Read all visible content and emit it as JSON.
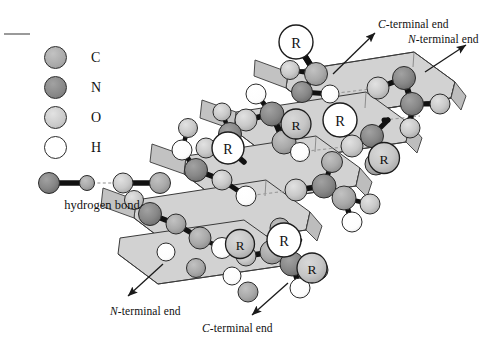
{
  "figure": {
    "background_color": "#ffffff"
  },
  "colors": {
    "carbon": "#a9a9a9",
    "nitrogen": "#878787",
    "oxygen": "#c9c9c9",
    "hydrogen": "#ffffff",
    "r_group_front": "#ffffff",
    "r_group_back": "#c6c6c6",
    "ribbon_top": "#d2d2d2",
    "ribbon_side": "#bdbdbd",
    "ribbon_edge": "#3a3a3a",
    "bond": "#111111",
    "hydrogen_bond": "#9b9b9b",
    "outline": "#2b2b2b",
    "arrow": "#1a1a1a",
    "crop_mark": "#9a9a9a"
  },
  "legend": {
    "atoms": [
      {
        "symbol": "C",
        "name": "carbon",
        "color_key": "carbon"
      },
      {
        "symbol": "N",
        "name": "nitrogen",
        "color_key": "nitrogen"
      },
      {
        "symbol": "O",
        "name": "oxygen",
        "color_key": "oxygen"
      },
      {
        "symbol": "H",
        "name": "hydrogen",
        "color_key": "hydrogen"
      }
    ],
    "bond_example": {
      "caption": "hydrogen bond",
      "atoms": [
        "N",
        "H",
        "O",
        "C"
      ],
      "bond_types": [
        "covalent",
        "hydrogen",
        "covalent"
      ]
    }
  },
  "diagram": {
    "r_group_label": "R",
    "terminal_labels": [
      {
        "id": "c-term-top",
        "prefix": "C",
        "text": "-terminal end",
        "arrow": "up-right"
      },
      {
        "id": "n-term-top",
        "prefix": "N",
        "text": "-terminal end",
        "arrow": "up-right"
      },
      {
        "id": "n-term-bottom",
        "prefix": "N",
        "text": "-terminal end",
        "arrow": "down-left"
      },
      {
        "id": "c-term-bottom",
        "prefix": "C",
        "text": "-terminal end",
        "arrow": "down-left"
      }
    ],
    "strand_count": 4,
    "r_group_count": 8
  }
}
